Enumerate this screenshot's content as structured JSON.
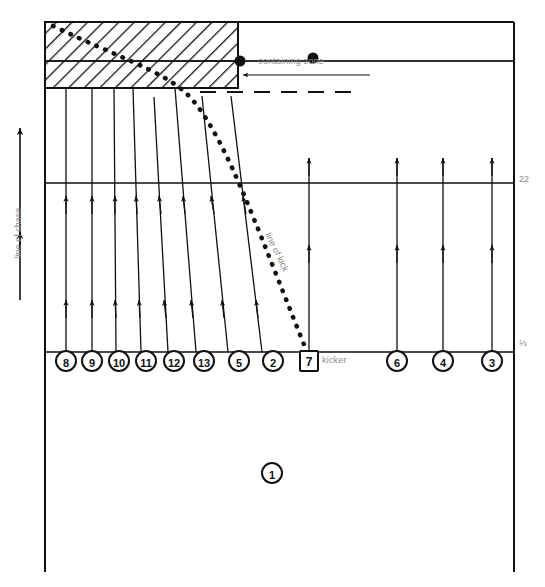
{
  "diagram": {
    "type": "sports-tactics-field-diagram",
    "colors": {
      "line": "#111111",
      "label": "#8c8c8c",
      "background": "#ffffff",
      "hatch": "#111111"
    },
    "field": {
      "left": 45,
      "right": 514,
      "top": 22,
      "bottom": 572,
      "lines": [
        {
          "name": "line-22",
          "y": 183,
          "label": "22"
        },
        {
          "name": "line-halfway",
          "y": 352,
          "label": "½"
        },
        {
          "name": "line-zone-inner",
          "y": 61,
          "label": ""
        }
      ]
    },
    "labels": {
      "containing_zone": "containing zone",
      "kicker": "kicker",
      "line_of_chase": "line of chase",
      "line_of_kick": "line of kick",
      "mark_22": "22",
      "mark_half": "⅓"
    },
    "containing_zone": {
      "name": "containing-zone",
      "x": 45,
      "y": 22,
      "width": 193,
      "height": 66,
      "divider_y": 61,
      "hatched": true
    },
    "dots": [
      {
        "name": "ball-dot-left",
        "cx": 240,
        "cy": 61,
        "r": 5
      },
      {
        "name": "ball-dot-right",
        "cx": 313,
        "cy": 58,
        "r": 5
      }
    ],
    "dashed_line": {
      "name": "dashed-guide",
      "x1": 200,
      "x2": 362,
      "y": 92
    },
    "players": [
      {
        "id": "8",
        "shape": "circle",
        "cx": 66,
        "cy": 361,
        "line_top_x": 66,
        "line_top_y": 88
      },
      {
        "id": "9",
        "shape": "circle",
        "cx": 92,
        "cy": 361,
        "line_top_x": 92,
        "line_top_y": 88
      },
      {
        "id": "10",
        "shape": "circle",
        "cx": 119,
        "cy": 361,
        "line_top_x": 114,
        "line_top_y": 88
      },
      {
        "id": "11",
        "shape": "circle",
        "cx": 146,
        "cy": 361,
        "line_top_x": 133,
        "line_top_y": 88
      },
      {
        "id": "12",
        "shape": "circle",
        "cx": 174,
        "cy": 361,
        "line_top_x": 154,
        "line_top_y": 97
      },
      {
        "id": "13",
        "shape": "circle",
        "cx": 204,
        "cy": 361,
        "line_top_x": 175,
        "line_top_y": 88
      },
      {
        "id": "5",
        "shape": "circle",
        "cx": 239,
        "cy": 361,
        "line_top_x": 202,
        "line_top_y": 96
      },
      {
        "id": "2",
        "shape": "circle",
        "cx": 273,
        "cy": 361,
        "line_top_x": 231,
        "line_top_y": 96
      },
      {
        "id": "7",
        "shape": "box",
        "cx": 309,
        "cy": 361,
        "line_top_x": 309,
        "line_top_y": 158
      },
      {
        "id": "6",
        "shape": "circle",
        "cx": 397,
        "cy": 361,
        "line_top_x": 397,
        "line_top_y": 158
      },
      {
        "id": "4",
        "shape": "circle",
        "cx": 443,
        "cy": 361,
        "line_top_x": 443,
        "line_top_y": 158
      },
      {
        "id": "3",
        "shape": "circle",
        "cx": 492,
        "cy": 361,
        "line_top_x": 492,
        "line_top_y": 158
      },
      {
        "id": "1",
        "shape": "circle",
        "cx": 272,
        "cy": 473,
        "line_top_x": null,
        "line_top_y": null
      }
    ],
    "chase_arrow": {
      "name": "line-of-chase-arrow",
      "x": 20,
      "y_top": 128,
      "y_bottom": 300
    },
    "kick_line": {
      "name": "line-of-kick",
      "style": "dotted",
      "points": [
        [
          53,
          26
        ],
        [
          185,
          92
        ],
        [
          246,
          216
        ],
        [
          307,
          352
        ]
      ]
    }
  }
}
